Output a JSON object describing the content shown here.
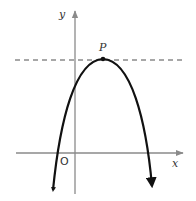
{
  "diagram": {
    "type": "parabola-graph",
    "labels": {
      "y_axis": "y",
      "x_axis": "x",
      "origin": "O",
      "vertex": "P"
    },
    "colors": {
      "axis": "#8a8a8a",
      "curve": "#111111",
      "dashed_line": "#8a8a8a",
      "label": "#333333"
    },
    "elements": {
      "curve": "downward-opening parabola with vertex P, arrowheads at both ends",
      "dashed_line": "horizontal tangent line through P"
    }
  }
}
